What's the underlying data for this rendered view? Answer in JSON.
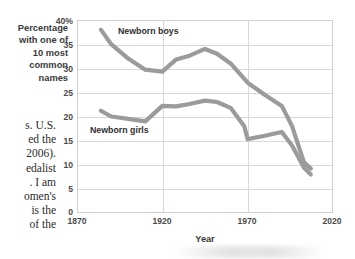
{
  "page": {
    "background_color": "#ffffff",
    "body_text_fragments": [
      "s. U.S.",
      "ed the",
      "2006).",
      "edalist",
      ". I am",
      "omen's",
      " is the",
      "of the"
    ]
  },
  "chart_data": {
    "type": "line",
    "title": "",
    "xlabel": "Year",
    "ylabel": "Percentage with one of 10 most common names",
    "ylabel_lines": [
      "Percentage",
      "with one of",
      "10 most",
      "common",
      "names"
    ],
    "xlim": [
      1870,
      2020
    ],
    "ylim": [
      0,
      40
    ],
    "xticks": [
      "1870",
      "1920",
      "1970",
      "2020"
    ],
    "xtick_values": [
      1870,
      1920,
      1970,
      2020
    ],
    "yticks": [
      "0",
      "5",
      "10",
      "15",
      "20",
      "25",
      "30",
      "35",
      "40%"
    ],
    "ytick_values": [
      0,
      5,
      10,
      15,
      20,
      25,
      30,
      35,
      40
    ],
    "grid": "horizontal-and-vertical",
    "legend_position": "inline-annotation",
    "line_color": "#9b9b9b",
    "grid_color": "#d8d8d8",
    "series": [
      {
        "name": "Newborn boys",
        "label": "Newborn boys",
        "x": [
          1884,
          1890,
          1900,
          1910,
          1920,
          1928,
          1936,
          1945,
          1952,
          1960,
          1970,
          1980,
          1990,
          1996,
          2003,
          2007
        ],
        "values": [
          38.0,
          35.0,
          32.0,
          29.7,
          29.3,
          31.8,
          32.6,
          34.0,
          33.0,
          31.0,
          27.0,
          24.5,
          22.2,
          18.0,
          10.5,
          9.2
        ]
      },
      {
        "name": "Newborn girls",
        "label": "Newborn girls",
        "x": [
          1884,
          1890,
          1900,
          1910,
          1920,
          1928,
          1936,
          1945,
          1952,
          1960,
          1968,
          1970,
          1980,
          1990,
          1996,
          2003,
          2007
        ],
        "values": [
          21.2,
          20.0,
          19.5,
          19.0,
          22.2,
          22.1,
          22.6,
          23.3,
          23.0,
          21.8,
          18.0,
          15.3,
          16.0,
          16.8,
          14.0,
          9.4,
          8.0
        ]
      }
    ]
  }
}
